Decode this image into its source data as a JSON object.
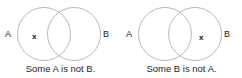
{
  "image": {
    "title": "Venn diagram pair: particular negative statements",
    "background_color": "#ffffff",
    "stroke_color": "#b9b9b9",
    "text_color": "#1c1c1c",
    "width": 242,
    "height": 78
  },
  "diagrams": [
    {
      "id": "some-a-is-not-b",
      "left_circle_label": "A",
      "right_circle_label": "B",
      "x_mark": "x",
      "x_mark_region": "A only",
      "caption": "Some A is not B."
    },
    {
      "id": "some-b-is-not-a",
      "left_circle_label": "A",
      "right_circle_label": "B",
      "x_mark": "x",
      "x_mark_region": "B only",
      "caption": "Some B is not A."
    }
  ],
  "geometry": {
    "circle_radius": 26,
    "left_circle_cx": 44,
    "right_circle_cx": 74,
    "circle_cy": 34
  }
}
